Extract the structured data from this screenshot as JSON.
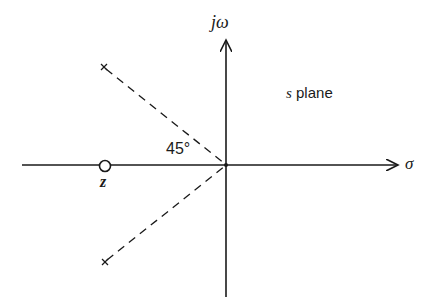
{
  "diagram": {
    "title": "s plane",
    "axes": {
      "vertical_label": "jω",
      "horizontal_label": "σ"
    },
    "angle_label": "45°",
    "zero_label": "z",
    "plane_label_var": "s",
    "plane_label_text": "plane",
    "elements": {
      "zero": {
        "type": "zero",
        "symbol": "circle",
        "position": "negative real axis"
      },
      "poles": [
        {
          "type": "pole",
          "symbol": "x",
          "position": "upper-left"
        },
        {
          "type": "pole",
          "symbol": "x",
          "position": "lower-left"
        }
      ],
      "asymptotes": "dashed lines from poles to origin at 45°"
    },
    "colors": {
      "ink": "#1a1a1a",
      "background": "#ffffff"
    }
  }
}
